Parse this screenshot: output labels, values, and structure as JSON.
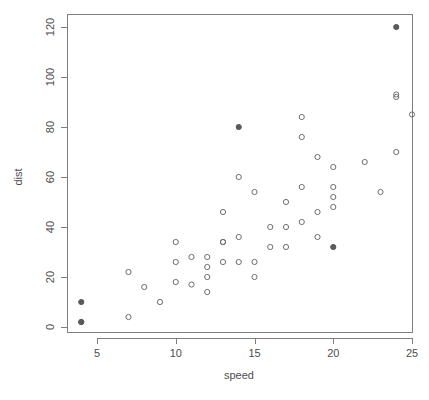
{
  "chart_data": {
    "type": "scatter",
    "title": "",
    "xlabel": "speed",
    "ylabel": "dist",
    "xlim": [
      2.4,
      25.6
    ],
    "ylim": [
      -4,
      126
    ],
    "xticks": [
      5,
      10,
      15,
      20,
      25
    ],
    "yticks": [
      0,
      20,
      40,
      60,
      80,
      100,
      120
    ],
    "grid": false,
    "legend": "none",
    "series": [
      {
        "name": "unhighlighted",
        "marker": "open-circle",
        "color": "#6e6e6e",
        "points": [
          {
            "x": 4,
            "y": 2
          },
          {
            "x": 7,
            "y": 4
          },
          {
            "x": 7,
            "y": 22
          },
          {
            "x": 8,
            "y": 16
          },
          {
            "x": 9,
            "y": 10
          },
          {
            "x": 10,
            "y": 18
          },
          {
            "x": 10,
            "y": 26
          },
          {
            "x": 10,
            "y": 34
          },
          {
            "x": 11,
            "y": 17
          },
          {
            "x": 11,
            "y": 28
          },
          {
            "x": 12,
            "y": 14
          },
          {
            "x": 12,
            "y": 20
          },
          {
            "x": 12,
            "y": 24
          },
          {
            "x": 12,
            "y": 28
          },
          {
            "x": 13,
            "y": 26
          },
          {
            "x": 13,
            "y": 34
          },
          {
            "x": 13,
            "y": 34
          },
          {
            "x": 13,
            "y": 46
          },
          {
            "x": 14,
            "y": 26
          },
          {
            "x": 14,
            "y": 36
          },
          {
            "x": 14,
            "y": 60
          },
          {
            "x": 15,
            "y": 20
          },
          {
            "x": 15,
            "y": 26
          },
          {
            "x": 15,
            "y": 54
          },
          {
            "x": 16,
            "y": 32
          },
          {
            "x": 16,
            "y": 40
          },
          {
            "x": 17,
            "y": 32
          },
          {
            "x": 17,
            "y": 40
          },
          {
            "x": 17,
            "y": 50
          },
          {
            "x": 18,
            "y": 42
          },
          {
            "x": 18,
            "y": 56
          },
          {
            "x": 18,
            "y": 76
          },
          {
            "x": 18,
            "y": 84
          },
          {
            "x": 19,
            "y": 36
          },
          {
            "x": 19,
            "y": 46
          },
          {
            "x": 19,
            "y": 68
          },
          {
            "x": 20,
            "y": 48
          },
          {
            "x": 20,
            "y": 52
          },
          {
            "x": 20,
            "y": 56
          },
          {
            "x": 20,
            "y": 64
          },
          {
            "x": 22,
            "y": 66
          },
          {
            "x": 23,
            "y": 54
          },
          {
            "x": 24,
            "y": 70
          },
          {
            "x": 24,
            "y": 92
          },
          {
            "x": 24,
            "y": 93
          },
          {
            "x": 25,
            "y": 85
          }
        ]
      },
      {
        "name": "highlighted",
        "marker": "filled-circle",
        "color": "#5a5a5a",
        "points": [
          {
            "x": 4,
            "y": 2
          },
          {
            "x": 4,
            "y": 10
          },
          {
            "x": 14,
            "y": 80
          },
          {
            "x": 20,
            "y": 32
          },
          {
            "x": 24,
            "y": 120
          }
        ]
      }
    ]
  },
  "axis": {
    "x_title": "speed",
    "y_title": "dist"
  },
  "colors": {
    "frame": "#7d7d7d",
    "text": "#4d4d4d",
    "open_point": "#6e6e6e",
    "filled_point": "#5a5a5a",
    "background": "#ffffff"
  }
}
